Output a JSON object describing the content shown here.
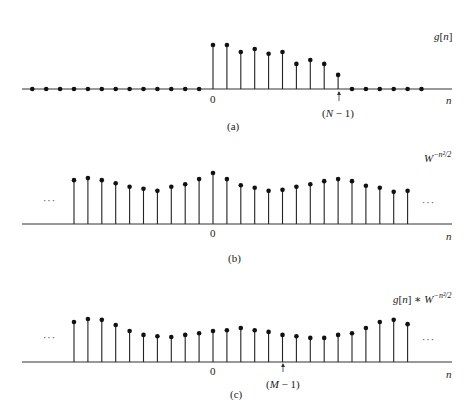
{
  "chart_data": [
    {
      "type": "stem",
      "panel": "a",
      "caption": "(a)",
      "signal_label": "g[n]",
      "xlabel": "n",
      "zero_label": "0",
      "marker_label": "(N − 1)",
      "marker_index": 9,
      "ellipsis": false,
      "n": [
        -13,
        -12,
        -11,
        -10,
        -9,
        -8,
        -7,
        -6,
        -5,
        -4,
        -3,
        -2,
        -1,
        0,
        1,
        2,
        3,
        4,
        5,
        6,
        7,
        8,
        9,
        10,
        11,
        12,
        13,
        14,
        15
      ],
      "values": [
        0,
        0,
        0,
        0,
        0,
        0,
        0,
        0,
        0,
        0,
        0,
        0,
        0,
        1.0,
        1.0,
        0.84,
        0.91,
        0.8,
        0.84,
        0.57,
        0.66,
        0.57,
        0.32,
        0,
        0,
        0,
        0,
        0,
        0
      ]
    },
    {
      "type": "stem",
      "panel": "b",
      "caption": "(b)",
      "signal_label": "W^{-n²/2}",
      "xlabel": "n",
      "zero_label": "0",
      "ellipsis": true,
      "n": [
        -10,
        -9,
        -8,
        -7,
        -6,
        -5,
        -4,
        -3,
        -2,
        -1,
        0,
        1,
        2,
        3,
        4,
        5,
        6,
        7,
        8,
        9,
        10,
        11,
        12,
        13,
        14
      ],
      "values": [
        0.86,
        0.9,
        0.86,
        0.8,
        0.73,
        0.69,
        0.65,
        0.73,
        0.78,
        0.88,
        1.0,
        0.88,
        0.76,
        0.71,
        0.65,
        0.67,
        0.73,
        0.78,
        0.84,
        0.88,
        0.84,
        0.75,
        0.71,
        0.63,
        0.65
      ]
    },
    {
      "type": "stem",
      "panel": "c",
      "caption": "(c)",
      "signal_label": "g[n] * W^{-n²/2}",
      "xlabel": "n",
      "zero_label": "0",
      "marker_label": "(M − 1)",
      "marker_index": 5,
      "ellipsis": true,
      "n": [
        -10,
        -9,
        -8,
        -7,
        -6,
        -5,
        -4,
        -3,
        -2,
        -1,
        0,
        1,
        2,
        3,
        4,
        5,
        6,
        7,
        8,
        9,
        10,
        11,
        12,
        13,
        14
      ],
      "values": [
        0.93,
        1.0,
        0.98,
        0.86,
        0.72,
        0.63,
        0.6,
        0.58,
        0.63,
        0.67,
        0.72,
        0.74,
        0.79,
        0.74,
        0.7,
        0.63,
        0.6,
        0.56,
        0.56,
        0.63,
        0.67,
        0.79,
        0.93,
        0.98,
        0.88
      ]
    }
  ],
  "labels": {
    "a": {
      "signal": "g[n]",
      "caption": "(a)",
      "zero": "0",
      "axis": "n",
      "marker": "(N − 1)"
    },
    "b": {
      "signal_base": "W",
      "signal_exp": "−n²/2",
      "caption": "(b)",
      "zero": "0",
      "axis": "n",
      "ellipsis": "···"
    },
    "c": {
      "signal_pre": "g[n] * W",
      "signal_exp": "−n²/2",
      "caption": "(c)",
      "zero": "0",
      "axis": "n",
      "marker": "(M − 1)",
      "ellipsis": "···"
    }
  }
}
